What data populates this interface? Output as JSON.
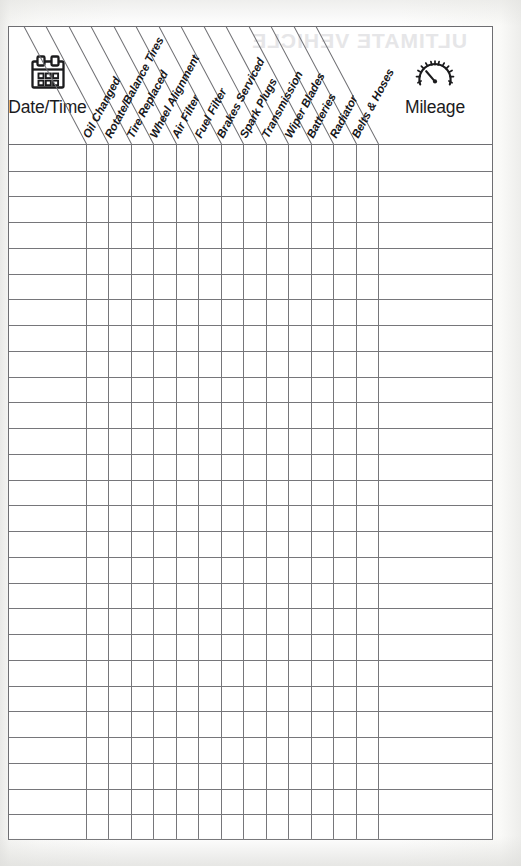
{
  "document": {
    "title": "Vehicle Maintenance Log",
    "watermark_showthrough": "ULTIMATE VEHICLE"
  },
  "table": {
    "date_column": {
      "label": "Date/Time",
      "icon": "calendar-icon"
    },
    "mileage_column": {
      "label": "Mileage",
      "icon": "gauge-icon"
    },
    "service_columns": [
      {
        "label": "Oil Changed"
      },
      {
        "label": "Rotate/Balance Tires"
      },
      {
        "label": "Tire Replaced"
      },
      {
        "label": "Wheel Alignment"
      },
      {
        "label": "Air Filter"
      },
      {
        "label": "Fuel Filter"
      },
      {
        "label": "Brakes Serviced"
      },
      {
        "label": "Spark Plugs"
      },
      {
        "label": "Transmission"
      },
      {
        "label": "Wiper Blades"
      },
      {
        "label": "Batteries"
      },
      {
        "label": "Radiator"
      },
      {
        "label": "Belts & Hoses"
      }
    ],
    "row_count": 27,
    "rows": [
      {
        "date": "",
        "mileage": "",
        "checks": [
          "",
          "",
          "",
          "",
          "",
          "",
          "",
          "",
          "",
          "",
          "",
          "",
          ""
        ]
      },
      {
        "date": "",
        "mileage": "",
        "checks": [
          "",
          "",
          "",
          "",
          "",
          "",
          "",
          "",
          "",
          "",
          "",
          "",
          ""
        ]
      },
      {
        "date": "",
        "mileage": "",
        "checks": [
          "",
          "",
          "",
          "",
          "",
          "",
          "",
          "",
          "",
          "",
          "",
          "",
          ""
        ]
      },
      {
        "date": "",
        "mileage": "",
        "checks": [
          "",
          "",
          "",
          "",
          "",
          "",
          "",
          "",
          "",
          "",
          "",
          "",
          ""
        ]
      },
      {
        "date": "",
        "mileage": "",
        "checks": [
          "",
          "",
          "",
          "",
          "",
          "",
          "",
          "",
          "",
          "",
          "",
          "",
          ""
        ]
      },
      {
        "date": "",
        "mileage": "",
        "checks": [
          "",
          "",
          "",
          "",
          "",
          "",
          "",
          "",
          "",
          "",
          "",
          "",
          ""
        ]
      },
      {
        "date": "",
        "mileage": "",
        "checks": [
          "",
          "",
          "",
          "",
          "",
          "",
          "",
          "",
          "",
          "",
          "",
          "",
          ""
        ]
      },
      {
        "date": "",
        "mileage": "",
        "checks": [
          "",
          "",
          "",
          "",
          "",
          "",
          "",
          "",
          "",
          "",
          "",
          "",
          ""
        ]
      },
      {
        "date": "",
        "mileage": "",
        "checks": [
          "",
          "",
          "",
          "",
          "",
          "",
          "",
          "",
          "",
          "",
          "",
          "",
          ""
        ]
      },
      {
        "date": "",
        "mileage": "",
        "checks": [
          "",
          "",
          "",
          "",
          "",
          "",
          "",
          "",
          "",
          "",
          "",
          "",
          ""
        ]
      },
      {
        "date": "",
        "mileage": "",
        "checks": [
          "",
          "",
          "",
          "",
          "",
          "",
          "",
          "",
          "",
          "",
          "",
          "",
          ""
        ]
      },
      {
        "date": "",
        "mileage": "",
        "checks": [
          "",
          "",
          "",
          "",
          "",
          "",
          "",
          "",
          "",
          "",
          "",
          "",
          ""
        ]
      },
      {
        "date": "",
        "mileage": "",
        "checks": [
          "",
          "",
          "",
          "",
          "",
          "",
          "",
          "",
          "",
          "",
          "",
          "",
          ""
        ]
      },
      {
        "date": "",
        "mileage": "",
        "checks": [
          "",
          "",
          "",
          "",
          "",
          "",
          "",
          "",
          "",
          "",
          "",
          "",
          ""
        ]
      },
      {
        "date": "",
        "mileage": "",
        "checks": [
          "",
          "",
          "",
          "",
          "",
          "",
          "",
          "",
          "",
          "",
          "",
          "",
          ""
        ]
      },
      {
        "date": "",
        "mileage": "",
        "checks": [
          "",
          "",
          "",
          "",
          "",
          "",
          "",
          "",
          "",
          "",
          "",
          "",
          ""
        ]
      },
      {
        "date": "",
        "mileage": "",
        "checks": [
          "",
          "",
          "",
          "",
          "",
          "",
          "",
          "",
          "",
          "",
          "",
          "",
          ""
        ]
      },
      {
        "date": "",
        "mileage": "",
        "checks": [
          "",
          "",
          "",
          "",
          "",
          "",
          "",
          "",
          "",
          "",
          "",
          "",
          ""
        ]
      },
      {
        "date": "",
        "mileage": "",
        "checks": [
          "",
          "",
          "",
          "",
          "",
          "",
          "",
          "",
          "",
          "",
          "",
          "",
          ""
        ]
      },
      {
        "date": "",
        "mileage": "",
        "checks": [
          "",
          "",
          "",
          "",
          "",
          "",
          "",
          "",
          "",
          "",
          "",
          "",
          ""
        ]
      },
      {
        "date": "",
        "mileage": "",
        "checks": [
          "",
          "",
          "",
          "",
          "",
          "",
          "",
          "",
          "",
          "",
          "",
          "",
          ""
        ]
      },
      {
        "date": "",
        "mileage": "",
        "checks": [
          "",
          "",
          "",
          "",
          "",
          "",
          "",
          "",
          "",
          "",
          "",
          "",
          ""
        ]
      },
      {
        "date": "",
        "mileage": "",
        "checks": [
          "",
          "",
          "",
          "",
          "",
          "",
          "",
          "",
          "",
          "",
          "",
          "",
          ""
        ]
      },
      {
        "date": "",
        "mileage": "",
        "checks": [
          "",
          "",
          "",
          "",
          "",
          "",
          "",
          "",
          "",
          "",
          "",
          "",
          ""
        ]
      },
      {
        "date": "",
        "mileage": "",
        "checks": [
          "",
          "",
          "",
          "",
          "",
          "",
          "",
          "",
          "",
          "",
          "",
          "",
          ""
        ]
      },
      {
        "date": "",
        "mileage": "",
        "checks": [
          "",
          "",
          "",
          "",
          "",
          "",
          "",
          "",
          "",
          "",
          "",
          "",
          ""
        ]
      },
      {
        "date": "",
        "mileage": "",
        "checks": [
          "",
          "",
          "",
          "",
          "",
          "",
          "",
          "",
          "",
          "",
          "",
          "",
          ""
        ]
      }
    ]
  },
  "colors": {
    "grid_line": "#76767a",
    "border": "#6e6e72",
    "text": "#17171a",
    "paper": "#ffffff",
    "page_background": "#f4f4f2"
  },
  "geometry": {
    "date_col_width": 77,
    "service_col_width": 22.46,
    "mileage_col_width": 114,
    "row_height": 25.74,
    "header_height": 118,
    "label_rotation_deg": -62
  }
}
